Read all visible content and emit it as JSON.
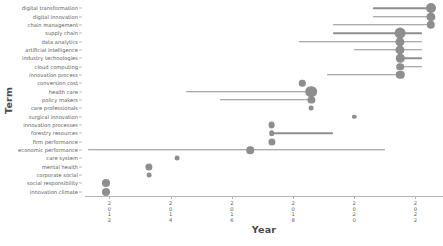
{
  "chart_data": {
    "type": "scatter",
    "title": "",
    "xlabel": "Year",
    "ylabel": "Term",
    "xlim": [
      2011.2,
      2022.9
    ],
    "ylim_categories_top_to_bottom": true,
    "grid": false,
    "legend": null,
    "xticks": [
      2012,
      2014,
      2016,
      2018,
      2020,
      2022
    ],
    "xtick_labels": [
      "2012",
      "2014",
      "2016",
      "2018",
      "2020",
      "2022"
    ],
    "categories": [
      "digital transformation",
      "digital innovation",
      "chain management",
      "supply chain",
      "data analytics",
      "artificial intelligence",
      "industry technologies",
      "cloud computing",
      "innovation process",
      "conversion cost",
      "health care",
      "policy makers",
      "care professionals",
      "surgical innovation",
      "innovation processes",
      "forestry resources",
      "firm performance",
      "economic performance",
      "care system",
      "mental health",
      "corporate social",
      "social responsibility",
      "innovation climate"
    ],
    "points": [
      {
        "term": "digital transformation",
        "start": 2020.6,
        "end": 2022.5,
        "peak": 2022.5,
        "size": 5.0
      },
      {
        "term": "digital innovation",
        "start": 2020.6,
        "end": 2022.5,
        "peak": 2022.5,
        "size": 4.6
      },
      {
        "term": "chain management",
        "start": 2019.3,
        "end": 2022.5,
        "peak": 2022.5,
        "size": 4.2
      },
      {
        "term": "supply chain",
        "start": 2019.3,
        "end": 2022.2,
        "peak": 2021.5,
        "size": 5.4
      },
      {
        "term": "data analytics",
        "start": 2018.2,
        "end": 2022.2,
        "peak": 2021.5,
        "size": 4.6
      },
      {
        "term": "artificial intelligence",
        "start": 2020.0,
        "end": 2022.2,
        "peak": 2021.5,
        "size": 4.6
      },
      {
        "term": "industry technologies",
        "start": 2021.5,
        "end": 2022.2,
        "peak": 2021.5,
        "size": 4.2
      },
      {
        "term": "cloud computing",
        "start": 2021.5,
        "end": 2022.2,
        "peak": 2021.5,
        "size": 3.8
      },
      {
        "term": "innovation process",
        "start": 2019.1,
        "end": 2021.5,
        "peak": 2021.5,
        "size": 4.2
      },
      {
        "term": "conversion cost",
        "start": 2018.3,
        "end": 2018.3,
        "peak": 2018.3,
        "size": 3.2
      },
      {
        "term": "health care",
        "start": 2014.5,
        "end": 2018.6,
        "peak": 2018.6,
        "size": 5.8
      },
      {
        "term": "policy makers",
        "start": 2015.6,
        "end": 2018.6,
        "peak": 2018.6,
        "size": 3.6
      },
      {
        "term": "care professionals",
        "start": 2018.6,
        "end": 2018.6,
        "peak": 2018.6,
        "size": 2.4
      },
      {
        "term": "surgical innovation",
        "start": 2020.0,
        "end": 2020.0,
        "peak": 2020.0,
        "size": 2.2
      },
      {
        "term": "innovation processes",
        "start": 2017.3,
        "end": 2017.3,
        "peak": 2017.3,
        "size": 3.4
      },
      {
        "term": "forestry resources",
        "start": 2017.3,
        "end": 2019.3,
        "peak": 2017.3,
        "size": 2.8
      },
      {
        "term": "firm performance",
        "start": 2017.3,
        "end": 2017.3,
        "peak": 2017.3,
        "size": 3.6
      },
      {
        "term": "economic performance",
        "start": 2011.3,
        "end": 2021.0,
        "peak": 2016.6,
        "size": 3.8
      },
      {
        "term": "care system",
        "start": 2014.2,
        "end": 2014.2,
        "peak": 2014.2,
        "size": 2.4
      },
      {
        "term": "mental health",
        "start": 2013.3,
        "end": 2013.3,
        "peak": 2013.3,
        "size": 3.6
      },
      {
        "term": "corporate social",
        "start": 2013.3,
        "end": 2013.3,
        "peak": 2013.3,
        "size": 2.4
      },
      {
        "term": "social responsibility",
        "start": 2011.9,
        "end": 2011.9,
        "peak": 2011.9,
        "size": 4.0
      },
      {
        "term": "innovation climate",
        "start": 2011.9,
        "end": 2011.9,
        "peak": 2011.9,
        "size": 4.0
      }
    ],
    "mark_color": "#8e8e8e",
    "axis_color": "#b5b5b5",
    "text_color": "#5c5c5c"
  }
}
